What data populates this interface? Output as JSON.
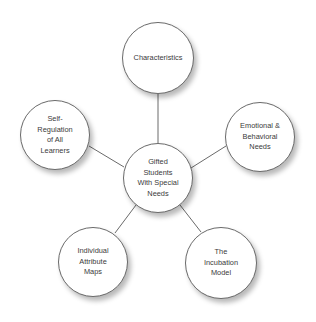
{
  "diagram": {
    "type": "hub-and-spoke",
    "center": {
      "id": "center",
      "label": "Gifted\nStudents\nWith Special\nNeeds",
      "cx": 158,
      "cy": 178,
      "r": 35
    },
    "nodes": [
      {
        "id": "characteristics",
        "label": "Characteristics",
        "cx": 158,
        "cy": 58,
        "r": 36
      },
      {
        "id": "emotional",
        "label": "Emotional &\nBehavioral\nNeeds",
        "cx": 260,
        "cy": 137,
        "r": 35
      },
      {
        "id": "incubation",
        "label": "The\nIncubation\nModel",
        "cx": 221,
        "cy": 263,
        "r": 36
      },
      {
        "id": "individual",
        "label": "Individual\nAttribute\nMaps",
        "cx": 93,
        "cy": 262,
        "r": 35
      },
      {
        "id": "self-regulation",
        "label": "Self-\nRegulation\nof All\nLearners",
        "cx": 55,
        "cy": 135,
        "r": 35
      }
    ],
    "colors": {
      "line": "#6a6a6a",
      "border": "#6a6a6a",
      "text": "#3a3a3a",
      "fill": "#ffffff"
    }
  }
}
